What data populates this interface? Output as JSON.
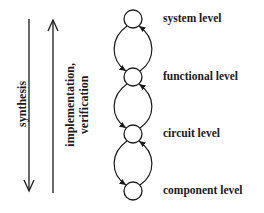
{
  "diagram": {
    "levels": [
      {
        "label": "system level",
        "cy": 19
      },
      {
        "label": "functional level",
        "cy": 77
      },
      {
        "label": "circuit level",
        "cy": 134
      },
      {
        "label": "component level",
        "cy": 191
      }
    ],
    "arrows": {
      "synthesis": {
        "label": "synthesis",
        "direction": "down"
      },
      "implementation": {
        "line1": "implementation,",
        "line2": "verification",
        "direction": "up"
      }
    },
    "colors": {
      "stroke": "#1a1a1a",
      "background": "#ffffff"
    }
  }
}
